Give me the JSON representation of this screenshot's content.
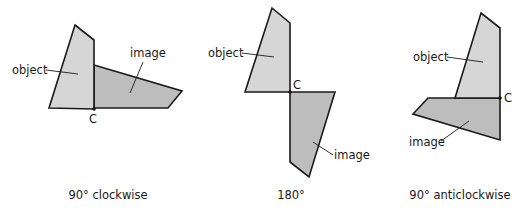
{
  "figure": {
    "colors": {
      "object_fill": "#d6d6d6",
      "image_fill": "#bdbdbd",
      "outline": "#1a1a1a",
      "background": "#ffffff"
    },
    "panels": [
      {
        "id": "clockwise",
        "caption": "90° clockwise",
        "centre_label": "C",
        "object_label": "object",
        "image_label": "image",
        "object_points": "75,25 94,40 94,109 49,108",
        "image_points": "94,65 182,91 168,108 94,108",
        "centre": {
          "x": 94,
          "y": 109
        },
        "centre_text": {
          "x": 89,
          "y": 123
        },
        "object_text": {
          "x": 12,
          "y": 74
        },
        "object_leader": {
          "x1": 46,
          "y1": 70,
          "x2": 78,
          "y2": 74
        },
        "image_text": {
          "x": 130,
          "y": 57
        },
        "image_leader": {
          "x1": 143,
          "y1": 62,
          "x2": 130,
          "y2": 93
        },
        "caption_pos": {
          "x": 108,
          "y": 199
        }
      },
      {
        "id": "half-turn",
        "caption": "180°",
        "centre_label": "C",
        "object_label": "object",
        "image_label": "image",
        "object_points": "272,8 290,23 290,92 245,92",
        "image_points": "290,92 335,92 309,177 290,162",
        "centre": {
          "x": 290,
          "y": 92
        },
        "centre_text": {
          "x": 293,
          "y": 89
        },
        "object_text": {
          "x": 208,
          "y": 57
        },
        "object_leader": {
          "x1": 242,
          "y1": 53,
          "x2": 274,
          "y2": 57
        },
        "image_text": {
          "x": 334,
          "y": 159
        },
        "image_leader": {
          "x1": 333,
          "y1": 155,
          "x2": 313,
          "y2": 142
        },
        "caption_pos": {
          "x": 291,
          "y": 199
        }
      },
      {
        "id": "anticlockwise",
        "caption": "90° anticlockwise",
        "centre_label": "C",
        "object_label": "object",
        "image_label": "image",
        "object_points": "481,13 500,28 500,98 455,98",
        "image_points": "428,98 500,98 500,140 413,114",
        "centre": {
          "x": 500,
          "y": 98
        },
        "centre_text": {
          "x": 504,
          "y": 102
        },
        "object_text": {
          "x": 413,
          "y": 61
        },
        "object_leader": {
          "x1": 447,
          "y1": 57,
          "x2": 483,
          "y2": 62
        },
        "image_text": {
          "x": 409,
          "y": 146
        },
        "image_leader": {
          "x1": 441,
          "y1": 141,
          "x2": 469,
          "y2": 121
        },
        "caption_pos": {
          "x": 460,
          "y": 199
        }
      }
    ]
  }
}
